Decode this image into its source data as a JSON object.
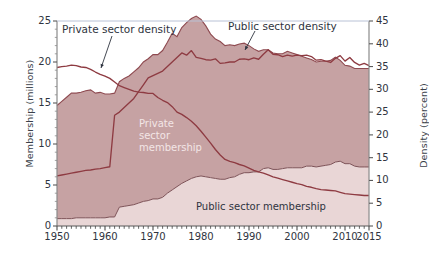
{
  "chart_data": {
    "type": "area",
    "title": "",
    "subtitle": "",
    "xlabel": "",
    "ylabel": "Membership (millions)",
    "y2label": "Density (percent)",
    "xlim": [
      1950,
      2015
    ],
    "ylim": [
      0,
      25
    ],
    "y2lim": [
      0,
      45
    ],
    "grid": false,
    "legend_position": "inline annotations",
    "x_tick_labels": [
      "1950",
      "1960",
      "1970",
      "1980",
      "1990",
      "2000",
      "2010",
      "2015"
    ],
    "x_tick_values": [
      1950,
      1960,
      1970,
      1980,
      1990,
      2000,
      2010,
      2015
    ],
    "y_tick_labels": [
      "0",
      "5",
      "10",
      "15",
      "20",
      "25"
    ],
    "y_tick_values": [
      0,
      5,
      10,
      15,
      20,
      25
    ],
    "y2_tick_labels": [
      "0",
      "5",
      "10",
      "15",
      "20",
      "25",
      "30",
      "35",
      "40",
      "45"
    ],
    "y2_tick_values": [
      0,
      5,
      10,
      15,
      20,
      25,
      30,
      35,
      40,
      45
    ],
    "minor_x_ticks": "every year",
    "annotations": [
      {
        "text": "Private sector density",
        "x": 1954.5,
        "y_axis": "right",
        "kind": "arrow-callout"
      },
      {
        "text": "Public sector density",
        "x": 1984.0,
        "y_axis": "right",
        "kind": "arrow-callout"
      },
      {
        "text": "Private sector membership",
        "x": 1971,
        "y_axis": "left",
        "kind": "inline-white"
      },
      {
        "text": "Public sector membership",
        "x": 1999,
        "y_axis": "left",
        "kind": "inline-dark"
      }
    ],
    "colors": {
      "private_area": "#c6a2a3",
      "public_area": "#e9d6d6",
      "line": "#8e3b42",
      "axis": "#8a8a8a",
      "text": "#2f3440",
      "inline_light_text": "#f3e6e6",
      "background": "#ffffff"
    },
    "x": [
      1950,
      1951,
      1952,
      1953,
      1954,
      1955,
      1956,
      1957,
      1958,
      1959,
      1960,
      1961,
      1962,
      1963,
      1964,
      1965,
      1966,
      1967,
      1968,
      1969,
      1970,
      1971,
      1972,
      1973,
      1974,
      1975,
      1976,
      1977,
      1978,
      1979,
      1980,
      1981,
      1982,
      1983,
      1984,
      1985,
      1986,
      1987,
      1988,
      1989,
      1990,
      1991,
      1992,
      1993,
      1994,
      1995,
      1996,
      1997,
      1998,
      1999,
      2000,
      2001,
      2002,
      2003,
      2004,
      2005,
      2006,
      2007,
      2008,
      2009,
      2010,
      2011,
      2012,
      2013,
      2014,
      2015
    ],
    "series": [
      {
        "name": "Public sector membership",
        "axis": "left",
        "units": "millions",
        "stack": "bottom",
        "values": [
          0.9,
          0.9,
          0.9,
          0.9,
          1.0,
          1.0,
          1.0,
          1.0,
          1.0,
          1.0,
          1.0,
          1.1,
          1.1,
          2.3,
          2.4,
          2.5,
          2.6,
          2.8,
          3.0,
          3.1,
          3.3,
          3.3,
          3.5,
          4.0,
          4.4,
          4.8,
          5.2,
          5.5,
          5.8,
          6.0,
          6.1,
          6.0,
          5.9,
          5.8,
          5.7,
          5.7,
          5.9,
          6.0,
          6.3,
          6.5,
          6.5,
          6.6,
          6.6,
          7.0,
          7.1,
          6.9,
          6.9,
          7.0,
          7.1,
          7.1,
          7.1,
          7.1,
          7.3,
          7.3,
          7.2,
          7.3,
          7.4,
          7.5,
          7.8,
          7.9,
          7.6,
          7.6,
          7.3,
          7.2,
          7.2,
          7.2
        ]
      },
      {
        "name": "Private sector membership",
        "axis": "left",
        "units": "millions",
        "stack": "top",
        "values": [
          13.8,
          14.3,
          14.8,
          15.3,
          15.2,
          15.3,
          15.5,
          15.6,
          15.2,
          15.3,
          15.1,
          15.0,
          15.1,
          15.3,
          15.6,
          15.8,
          16.2,
          16.5,
          17.0,
          17.3,
          17.6,
          17.6,
          17.9,
          18.4,
          19.1,
          18.3,
          19.0,
          19.3,
          19.5,
          19.6,
          19.1,
          18.4,
          17.5,
          17.0,
          16.8,
          16.3,
          16.2,
          16.0,
          15.9,
          15.8,
          15.5,
          15.0,
          14.7,
          14.5,
          14.4,
          14.2,
          14.1,
          14.0,
          14.2,
          14.0,
          13.8,
          13.6,
          13.2,
          13.0,
          12.8,
          12.8,
          12.7,
          12.7,
          12.8,
          12.3,
          12.0,
          11.9,
          11.9,
          12.0,
          12.0,
          12.0
        ]
      },
      {
        "name": "Private sector density",
        "axis": "right",
        "units": "percent",
        "values": [
          34.8,
          35.0,
          35.1,
          35.3,
          35.2,
          34.9,
          34.8,
          34.4,
          33.8,
          33.3,
          32.9,
          32.4,
          31.6,
          30.8,
          30.4,
          30.0,
          29.6,
          29.4,
          29.3,
          29.1,
          29.1,
          28.2,
          27.6,
          27.1,
          26.2,
          25.0,
          24.5,
          23.8,
          23.0,
          22.0,
          20.8,
          19.5,
          18.2,
          16.8,
          15.6,
          14.6,
          14.2,
          13.9,
          13.5,
          13.2,
          12.7,
          12.2,
          11.9,
          11.6,
          11.2,
          10.8,
          10.5,
          10.2,
          9.9,
          9.6,
          9.3,
          9.1,
          8.7,
          8.5,
          8.2,
          8.0,
          7.9,
          7.8,
          7.7,
          7.4,
          7.1,
          7.0,
          6.9,
          6.8,
          6.7,
          6.7
        ]
      },
      {
        "name": "Public sector density",
        "axis": "right",
        "units": "percent",
        "values": [
          11.0,
          11.2,
          11.4,
          11.6,
          11.8,
          12.0,
          12.2,
          12.3,
          12.5,
          12.6,
          12.8,
          13.0,
          24.3,
          25.0,
          26.0,
          27.0,
          28.0,
          29.5,
          31.0,
          32.5,
          33.0,
          33.5,
          34.0,
          35.0,
          36.0,
          37.0,
          38.0,
          37.5,
          38.5,
          37.0,
          36.8,
          36.5,
          36.4,
          36.7,
          35.7,
          35.8,
          36.0,
          36.0,
          36.6,
          36.7,
          36.5,
          36.9,
          36.6,
          37.7,
          38.7,
          37.7,
          37.6,
          37.2,
          37.5,
          37.3,
          37.5,
          37.4,
          37.5,
          37.2,
          36.4,
          36.5,
          36.2,
          35.9,
          36.8,
          37.4,
          36.2,
          37.0,
          35.9,
          35.3,
          35.7,
          35.2
        ]
      }
    ]
  },
  "labels": {
    "ylabel_left": "Membership (millions)",
    "ylabel_right": "Density (percent)",
    "private_density": "Private sector density",
    "public_density": "Public sector density",
    "private_membership_l1": "Private",
    "private_membership_l2": "sector",
    "private_membership_l3": "membership",
    "public_membership": "Public sector membership",
    "y_ticks": [
      "25",
      "20",
      "15",
      "10",
      "5",
      "0"
    ],
    "y2_ticks": [
      "45",
      "40",
      "35",
      "30",
      "25",
      "20",
      "15",
      "10",
      "5",
      "0"
    ],
    "x_ticks": [
      "1950",
      "1960",
      "1970",
      "1980",
      "1990",
      "2000",
      "2010",
      "2015"
    ]
  }
}
